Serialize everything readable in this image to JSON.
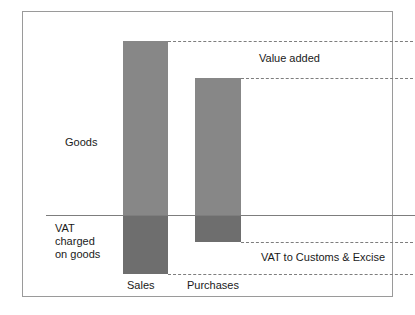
{
  "labels": {
    "goods": "Goods",
    "vat_charged_on_goods": "VAT\ncharged\non goods",
    "value_added": "Value added",
    "vat_to_customs": "VAT to Customs & Excise"
  },
  "chart_data": {
    "type": "bar",
    "title": "",
    "xlabel": "",
    "ylabel": "",
    "categories": [
      "Sales",
      "Purchases"
    ],
    "series": [
      {
        "name": "Goods (net, above VAT line)",
        "values": [
          174,
          137
        ],
        "color": "#878787"
      },
      {
        "name": "VAT charged on goods (below VAT line)",
        "values": [
          59,
          27
        ],
        "color": "#6e6e6e"
      }
    ],
    "annotations": [
      {
        "text": "Goods",
        "position": "left-of-bars-above-line"
      },
      {
        "text": "VAT charged on goods",
        "position": "left-of-bars-below-line"
      },
      {
        "text": "Value added",
        "position": "right-between-sales-top-and-purchases-top"
      },
      {
        "text": "VAT to Customs & Excise",
        "position": "right-between-purchases-bottom-and-sales-bottom"
      }
    ],
    "reference_lines": [
      {
        "name": "vat-baseline",
        "style": "solid",
        "from": "sales-top"
      },
      {
        "name": "sales-top-leader",
        "style": "dashed"
      },
      {
        "name": "purchases-top-leader",
        "style": "dashed"
      },
      {
        "name": "purchases-bottom-leader",
        "style": "dashed"
      },
      {
        "name": "sales-bottom-leader",
        "style": "dashed"
      }
    ],
    "grid": false,
    "legend": "none"
  },
  "colors": {
    "bar_upper": "#878787",
    "bar_lower": "#6e6e6e",
    "line": "#7d7d7d",
    "frame": "#9a9a9a",
    "text": "#1a1a1a",
    "background": "#ffffff"
  }
}
